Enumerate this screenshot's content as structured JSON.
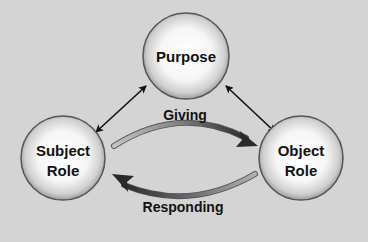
{
  "diagram": {
    "nodes": [
      {
        "id": "purpose",
        "lines": [
          "Purpose"
        ]
      },
      {
        "id": "subject",
        "lines": [
          "Subject",
          "Role"
        ]
      },
      {
        "id": "object",
        "lines": [
          "Object",
          "Role"
        ]
      }
    ],
    "links": [
      {
        "from": "purpose",
        "to": "subject",
        "type": "double-arrow"
      },
      {
        "from": "purpose",
        "to": "object",
        "type": "double-arrow"
      }
    ],
    "flows": [
      {
        "from": "subject",
        "to": "object",
        "label": "Giving"
      },
      {
        "from": "object",
        "to": "subject",
        "label": "Responding"
      }
    ],
    "colors": {
      "background": "#d4d4d4",
      "node_outline": "#555555",
      "text": "#111111",
      "arrow": "#111111",
      "flow_start": "#b8b8b8",
      "flow_end": "#2a2a2a"
    }
  }
}
